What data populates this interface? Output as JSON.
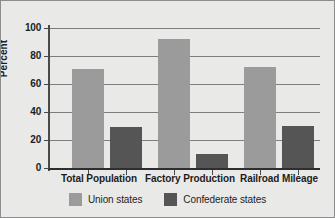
{
  "chart_data": {
    "type": "bar",
    "title": "",
    "xlabel": "",
    "ylabel": "Percent",
    "ylim": [
      0,
      100
    ],
    "yticks": [
      0,
      20,
      40,
      60,
      80,
      100
    ],
    "grid": true,
    "legend_position": "bottom",
    "categories": [
      "Total Population",
      "Factory Production",
      "Railroad Mileage"
    ],
    "series": [
      {
        "name": "Union states",
        "color": "#9b9b9b",
        "values": [
          71,
          92,
          72
        ]
      },
      {
        "name": "Confederate states",
        "color": "#555555",
        "values": [
          29,
          10,
          30
        ]
      }
    ]
  },
  "colors": {
    "background": "#e9e9e7",
    "frame": "#8d8d8d",
    "gridline": "#7d7d7d",
    "axis": "#2e2e2e",
    "text": "#1d1d1d",
    "union": "#9b9b9b",
    "confederate": "#555555"
  }
}
